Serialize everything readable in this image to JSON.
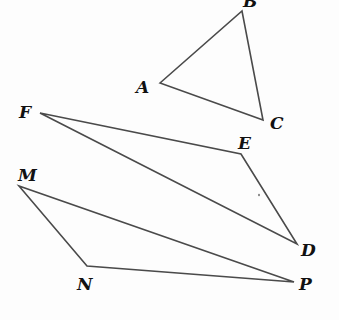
{
  "diagram": {
    "type": "geometry-figures",
    "colors": {
      "line": "#4a4a4a",
      "label": "#111111",
      "background": "#fdfdfd"
    },
    "figures": [
      {
        "name": "triangle-ABC",
        "vertices": [
          {
            "label": "A",
            "x": 160,
            "y": 83,
            "lx": 136,
            "ly": 93
          },
          {
            "label": "B",
            "x": 242,
            "y": 11,
            "lx": 243,
            "ly": 7
          },
          {
            "label": "C",
            "x": 263,
            "y": 120,
            "lx": 270,
            "ly": 129
          }
        ]
      },
      {
        "name": "triangle-FED",
        "vertices": [
          {
            "label": "F",
            "x": 40,
            "y": 113,
            "lx": 19,
            "ly": 118
          },
          {
            "label": "E",
            "x": 241,
            "y": 154,
            "lx": 238,
            "ly": 149
          },
          {
            "label": "D",
            "x": 297,
            "y": 244,
            "lx": 301,
            "ly": 256
          }
        ]
      },
      {
        "name": "triangle-MNP",
        "vertices": [
          {
            "label": "M",
            "x": 19,
            "y": 186,
            "lx": 18,
            "ly": 181
          },
          {
            "label": "N",
            "x": 87,
            "y": 266,
            "lx": 77,
            "ly": 290
          },
          {
            "label": "P",
            "x": 294,
            "y": 282,
            "lx": 299,
            "ly": 290
          }
        ]
      }
    ]
  }
}
